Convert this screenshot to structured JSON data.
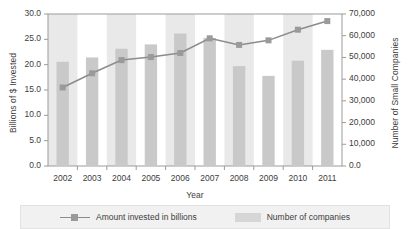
{
  "chart_data": {
    "type": "bar",
    "title": "",
    "xlabel": "Year",
    "categories": [
      "2002",
      "2003",
      "2004",
      "2005",
      "2006",
      "2007",
      "2008",
      "2009",
      "2010",
      "2011"
    ],
    "grid": false,
    "legend_position": "bottom",
    "series": [
      {
        "name": "Number of companies",
        "type": "bar",
        "axis": "right",
        "ylabel": "Number of Small Companies",
        "ylim": [
          0,
          70000
        ],
        "ytick_step": 10000,
        "color": "#c9c9c9",
        "values": [
          48000,
          50000,
          54000,
          56000,
          61000,
          59000,
          46000,
          41500,
          48500,
          53500
        ]
      },
      {
        "name": "Amount invested in billions",
        "type": "line",
        "axis": "left",
        "ylabel": "Billions of $ Invested",
        "ylim": [
          0,
          30
        ],
        "ytick_step": 5,
        "color": "#8c8c8c",
        "values": [
          15.5,
          18.3,
          20.9,
          21.5,
          22.3,
          25.2,
          23.9,
          24.8,
          26.9,
          28.6
        ]
      }
    ],
    "axes": {
      "left": {
        "label": "Billions of $ Invested",
        "ticks": [
          "0.0",
          "5.0",
          "10.0",
          "15.0",
          "20.0",
          "25.0",
          "30.0"
        ],
        "tick_values": [
          0,
          5,
          10,
          15,
          20,
          25,
          30
        ],
        "min": 0,
        "max": 30
      },
      "right": {
        "label": "Number of Small Companies",
        "ticks": [
          "0.0",
          "10,000",
          "20,000",
          "30,000",
          "40,000",
          "50,000",
          "60,000",
          "70,000"
        ],
        "tick_values": [
          0,
          10000,
          20000,
          30000,
          40000,
          50000,
          60000,
          70000
        ],
        "min": 0,
        "max": 70000
      },
      "x": {
        "label": "Year",
        "ticks": [
          "2002",
          "2003",
          "2004",
          "2005",
          "2006",
          "2007",
          "2008",
          "2009",
          "2010",
          "2011"
        ]
      }
    },
    "legend": [
      {
        "label": "Amount invested in billions",
        "marker": "line-square",
        "color": "#8c8c8c"
      },
      {
        "label": "Number of companies",
        "marker": "bar-swatch",
        "color": "#d6d6d6"
      }
    ]
  },
  "colors": {
    "bar": "#c9c9c9",
    "band": "#e9e9e9",
    "line": "#8c8c8c",
    "marker": "#9a9a9a",
    "frame": "#9b9b9b",
    "text": "#3d3d3d",
    "legend_bg": "#f1f1f1"
  }
}
